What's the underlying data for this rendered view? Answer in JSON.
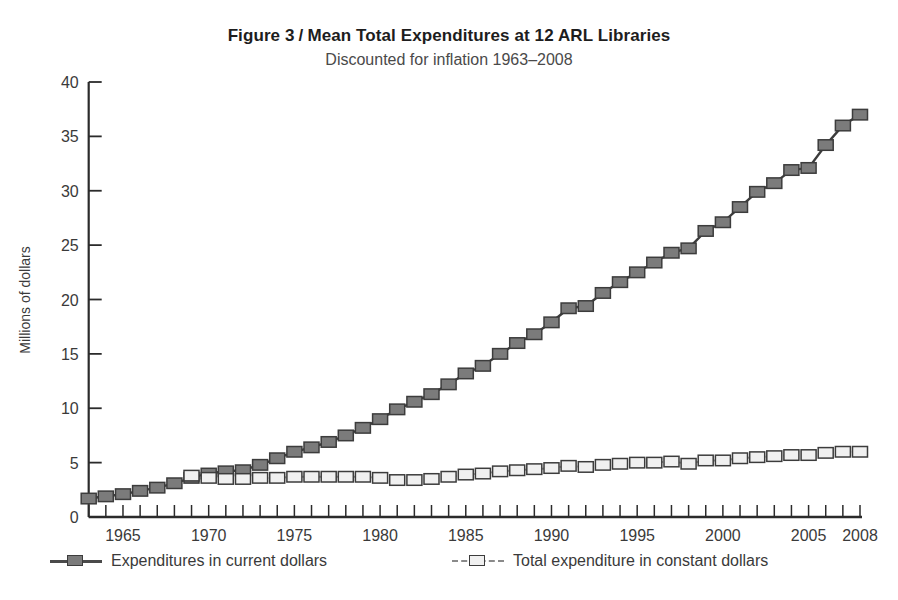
{
  "figure": {
    "title_prefix": "Figure 3",
    "title_separator": "/",
    "title_main": "Mean Total Expenditures at 12 ARL Libraries",
    "subtitle": "Discounted for inflation 1963–2008"
  },
  "legend": {
    "position": "below-axis",
    "items": [
      {
        "label": "Expenditures in current dollars",
        "marker": "filled-square",
        "line": "solid",
        "color": "#7b7b7b"
      },
      {
        "label": "Total expenditure in constant dollars",
        "marker": "open-square",
        "line": "dashed",
        "color": "#f0f0f0"
      }
    ]
  },
  "chart_data": {
    "type": "line",
    "subtitle": "Discounted for inflation 1963–2008",
    "xlabel": "",
    "ylabel": "Millions of dollars",
    "xlim": [
      1963,
      2008
    ],
    "ylim": [
      0,
      40
    ],
    "yticks": [
      0,
      5,
      10,
      15,
      20,
      25,
      30,
      35,
      40
    ],
    "ytick_labels": [
      "0",
      "5",
      "10",
      "15",
      "20",
      "25",
      "30",
      "35",
      "40"
    ],
    "xticks": [
      1963,
      1964,
      1965,
      1966,
      1967,
      1968,
      1969,
      1970,
      1971,
      1972,
      1973,
      1974,
      1975,
      1976,
      1977,
      1978,
      1979,
      1980,
      1981,
      1982,
      1983,
      1984,
      1985,
      1986,
      1987,
      1988,
      1989,
      1990,
      1991,
      1992,
      1993,
      1994,
      1995,
      1996,
      1997,
      1998,
      1999,
      2000,
      2001,
      2002,
      2003,
      2004,
      2005,
      2006,
      2007,
      2008
    ],
    "xtick_labels": [
      {
        "value": 1965,
        "label": "1965"
      },
      {
        "value": 1970,
        "label": "1970"
      },
      {
        "value": 1975,
        "label": "1975"
      },
      {
        "value": 1980,
        "label": "1980"
      },
      {
        "value": 1985,
        "label": "1985"
      },
      {
        "value": 1990,
        "label": "1990"
      },
      {
        "value": 1995,
        "label": "1995"
      },
      {
        "value": 2000,
        "label": "2000"
      },
      {
        "value": 2005,
        "label": "2005"
      },
      {
        "value": 2008,
        "label": "2008"
      }
    ],
    "grid": false,
    "x": [
      1963,
      1964,
      1965,
      1966,
      1967,
      1968,
      1969,
      1970,
      1971,
      1972,
      1973,
      1974,
      1975,
      1976,
      1977,
      1978,
      1979,
      1980,
      1981,
      1982,
      1983,
      1984,
      1985,
      1986,
      1987,
      1988,
      1989,
      1990,
      1991,
      1992,
      1993,
      1994,
      1995,
      1996,
      1997,
      1998,
      1999,
      2000,
      2001,
      2002,
      2003,
      2004,
      2005,
      2006,
      2007,
      2008
    ],
    "series": [
      {
        "name": "Expenditures in current dollars",
        "marker": "filled-square",
        "line": "solid",
        "color": "#7b7b7b",
        "values": [
          1.7,
          1.9,
          2.1,
          2.4,
          2.7,
          3.1,
          3.6,
          4.0,
          4.2,
          4.3,
          4.8,
          5.4,
          6.0,
          6.4,
          6.9,
          7.5,
          8.2,
          9.0,
          9.9,
          10.6,
          11.3,
          12.2,
          13.2,
          13.9,
          15.0,
          16.0,
          16.8,
          17.9,
          19.2,
          19.4,
          20.6,
          21.6,
          22.5,
          23.4,
          24.3,
          24.7,
          26.3,
          27.1,
          28.5,
          29.9,
          30.7,
          31.9,
          32.1,
          34.2,
          36.0,
          37.0
        ]
      },
      {
        "name": "Total expenditure in constant dollars",
        "marker": "open-square",
        "line": "dashed",
        "color": "#f0f0f0",
        "values": [
          null,
          null,
          null,
          null,
          null,
          null,
          3.8,
          3.6,
          3.5,
          3.5,
          3.6,
          3.6,
          3.7,
          3.7,
          3.7,
          3.7,
          3.7,
          3.6,
          3.4,
          3.4,
          3.5,
          3.7,
          3.9,
          4.0,
          4.2,
          4.3,
          4.4,
          4.5,
          4.7,
          4.6,
          4.8,
          4.9,
          5.0,
          5.0,
          5.1,
          4.9,
          5.2,
          5.2,
          5.4,
          5.5,
          5.6,
          5.7,
          5.7,
          5.9,
          6.0,
          6.0
        ]
      }
    ]
  }
}
